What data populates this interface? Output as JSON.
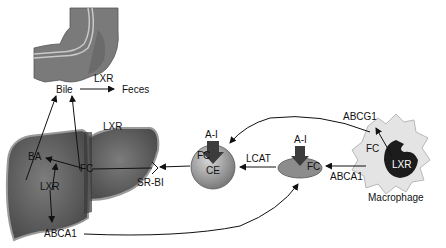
{
  "diagram": {
    "nodes": {
      "intestine": {
        "label": ""
      },
      "bile": {
        "label": "Bile"
      },
      "feces": {
        "label": "Feces"
      },
      "liver": {
        "label": ""
      },
      "macrophage": {
        "label": "Macrophage"
      },
      "hdl_mature": {
        "labels": [
          "A-I",
          "FC",
          "CE"
        ]
      },
      "hdl_nascent": {
        "labels": [
          "A-I",
          "FC"
        ]
      }
    },
    "labels": {
      "lxr_intestine": "LXR",
      "bile": "Bile",
      "feces": "Feces",
      "lxr_liver_top": "LXR",
      "ba": "BA",
      "fc_liver": "FC",
      "lxr_liver": "LXR",
      "srbi": "SR-BI",
      "abca1_liver": "ABCA1",
      "ai_mature": "A-I",
      "fc_mature": "FC",
      "ce_mature": "CE",
      "lcat": "LCAT",
      "ai_nascent": "A-I",
      "fc_nascent": "FC",
      "abcg1": "ABCG1",
      "fc_macrophage": "FC",
      "lxr_macrophage": "LXR",
      "abca1_macrophage": "ABCA1",
      "macrophage": "Macrophage"
    },
    "colors": {
      "organ_fill": "#6e6e6e",
      "organ_dark": "#4a4a4a",
      "hdl_fill": "#9a9a9a",
      "apo_arrow": "#3c3c3c",
      "macrophage_fill": "#e4e4e4",
      "nucleus": "#1c1c1c",
      "arrow": "#111111"
    }
  }
}
